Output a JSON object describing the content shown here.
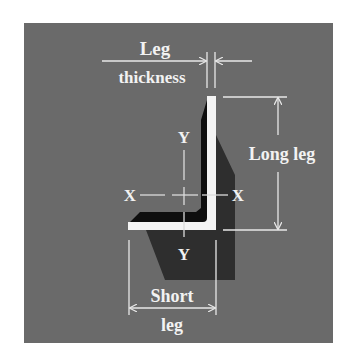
{
  "figure": {
    "colors": {
      "panel": "#6a6a6a",
      "shadow": "#2e2e2e",
      "inner_shadow": "#0e0e0e",
      "section": "#f4f4f4",
      "lines": "#e8e8e8",
      "text": "#f2f2f2"
    },
    "labels": {
      "leg_thickness_line1": "Leg",
      "leg_thickness_line2": "thickness",
      "long_leg": "Long leg",
      "short_leg_line1": "Short",
      "short_leg_line2": "leg",
      "x_axis_left": "X",
      "x_axis_right": "X",
      "y_axis_top": "Y",
      "y_axis_bottom": "Y"
    }
  }
}
